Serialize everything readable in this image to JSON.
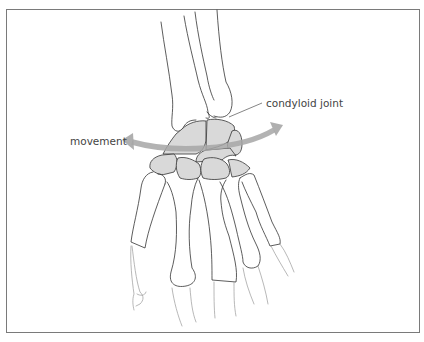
{
  "figure": {
    "labels": {
      "movement": "movement",
      "joint": "condyloid joint"
    },
    "colors": {
      "frame_border": "#7a7a7a",
      "bone_outline": "#333333",
      "carpal_fill": "#d9d9d9",
      "arrow": "#a9a9a9",
      "label_text": "#444444",
      "faded_phalanx": "#9a9a9a"
    }
  }
}
